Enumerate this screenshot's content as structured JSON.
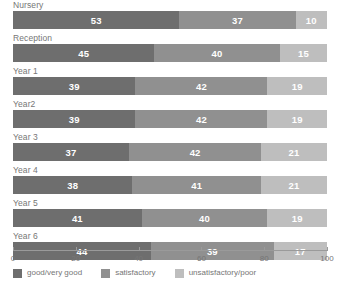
{
  "chart_data": {
    "type": "bar",
    "orientation": "horizontal",
    "stacked": true,
    "stack_mode": "percent",
    "title": "",
    "subtitle": "",
    "xlabel": "",
    "ylabel": "",
    "xlim": [
      0,
      100
    ],
    "xticks": [
      0,
      20,
      40,
      60,
      80,
      100
    ],
    "xticklabels": [
      "0",
      "20",
      "40",
      "60",
      "80",
      "100"
    ],
    "grid": false,
    "legend_position": "bottom-left",
    "categories": [
      "Nursery",
      "Reception",
      "Year 1",
      "Year2",
      "Year 3",
      "Year 4",
      "Year 5",
      "Year 6"
    ],
    "series": [
      {
        "name": "good/very good",
        "color": "#6e6e6e",
        "values": [
          53,
          45,
          39,
          39,
          37,
          38,
          41,
          44
        ]
      },
      {
        "name": "satisfactory",
        "color": "#909090",
        "values": [
          37,
          40,
          42,
          42,
          42,
          41,
          40,
          39
        ]
      },
      {
        "name": "unsatisfactory/poor",
        "color": "#bebebe",
        "values": [
          10,
          15,
          19,
          19,
          21,
          21,
          19,
          17
        ]
      }
    ]
  },
  "rows": [
    {
      "label": "Nursery",
      "segments": [
        {
          "value": 53,
          "text": "53"
        },
        {
          "value": 37,
          "text": "37"
        },
        {
          "value": 10,
          "text": "10"
        }
      ]
    },
    {
      "label": "Reception",
      "segments": [
        {
          "value": 45,
          "text": "45"
        },
        {
          "value": 40,
          "text": "40"
        },
        {
          "value": 15,
          "text": "15"
        }
      ]
    },
    {
      "label": "Year 1",
      "segments": [
        {
          "value": 39,
          "text": "39"
        },
        {
          "value": 42,
          "text": "42"
        },
        {
          "value": 19,
          "text": "19"
        }
      ]
    },
    {
      "label": "Year2",
      "segments": [
        {
          "value": 39,
          "text": "39"
        },
        {
          "value": 42,
          "text": "42"
        },
        {
          "value": 19,
          "text": "19"
        }
      ]
    },
    {
      "label": "Year 3",
      "segments": [
        {
          "value": 37,
          "text": "37"
        },
        {
          "value": 42,
          "text": "42"
        },
        {
          "value": 21,
          "text": "21"
        }
      ]
    },
    {
      "label": "Year 4",
      "segments": [
        {
          "value": 38,
          "text": "38"
        },
        {
          "value": 41,
          "text": "41"
        },
        {
          "value": 21,
          "text": "21"
        }
      ]
    },
    {
      "label": "Year 5",
      "segments": [
        {
          "value": 41,
          "text": "41"
        },
        {
          "value": 40,
          "text": "40"
        },
        {
          "value": 19,
          "text": "19"
        }
      ]
    },
    {
      "label": "Year 6",
      "segments": [
        {
          "value": 44,
          "text": "44"
        },
        {
          "value": 39,
          "text": "39"
        },
        {
          "value": 17,
          "text": "17"
        }
      ]
    }
  ],
  "axis": {
    "ticks": [
      {
        "value": 0,
        "label": "0"
      },
      {
        "value": 20,
        "label": "20"
      },
      {
        "value": 40,
        "label": "40"
      },
      {
        "value": 60,
        "label": "60"
      },
      {
        "value": 80,
        "label": "80"
      },
      {
        "value": 100,
        "label": "100"
      }
    ],
    "line_color": "#9a9a9a"
  },
  "legend": {
    "items": [
      {
        "label": "good/very good",
        "color": "#6e6e6e"
      },
      {
        "label": "satisfactory",
        "color": "#909090"
      },
      {
        "label": "unsatisfactory/poor",
        "color": "#bebebe"
      }
    ]
  }
}
